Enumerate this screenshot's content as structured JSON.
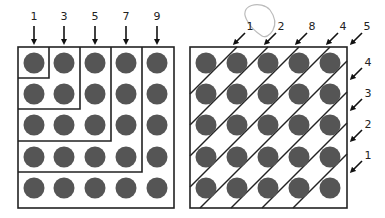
{
  "figure": {
    "left_panel": {
      "title": "Odd-number L-shaped groupings",
      "grid_rows": 5,
      "grid_cols": 5,
      "column_labels": [
        "1",
        "3",
        "5",
        "7",
        "9"
      ],
      "dot_color": "#555555",
      "line_color": "#222222"
    },
    "right_panel": {
      "title": "Diagonal groupings",
      "grid_rows": 5,
      "grid_cols": 5,
      "top_labels": [
        "1",
        "2",
        "8",
        "4",
        "5"
      ],
      "right_labels": [
        "4",
        "3",
        "2",
        "1"
      ],
      "annotation": "hand-drawn circle around label 8",
      "annotation_color": "#bbbbbb",
      "dot_color": "#555555",
      "line_color": "#222222"
    }
  }
}
